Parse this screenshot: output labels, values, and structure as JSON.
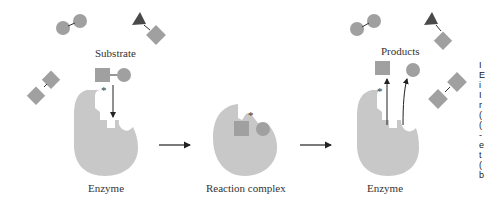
{
  "labels": {
    "substrate": "Substrate",
    "enzyme_left": "Enzyme",
    "reaction_complex": "Reaction complex",
    "products": "Products",
    "enzyme_right": "Enzyme",
    "active_site_marker": "*"
  },
  "colors": {
    "enzyme": "#c8c8c8",
    "molecule": "#a0a0a0",
    "triangle": "#4a4a4a",
    "arrow": "#222222",
    "text": "#333333"
  },
  "side_text": [
    "I",
    "E",
    "i",
    "I",
    "r",
    "(",
    "(",
    "-",
    "e",
    "t",
    "(",
    "b"
  ]
}
